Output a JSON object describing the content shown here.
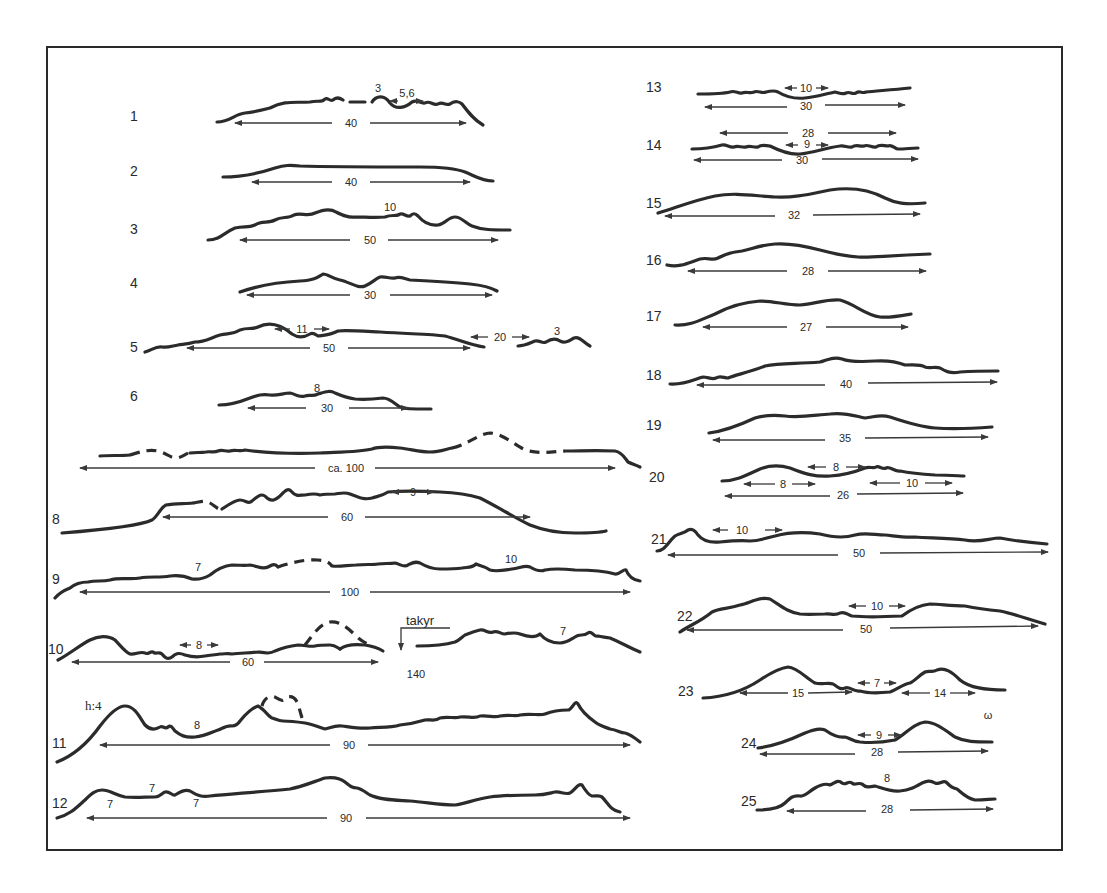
{
  "figure": {
    "type": "dune/relief profile sketches",
    "profiles": [
      {
        "id": "1",
        "label": "1",
        "span": "40",
        "annotations": [
          "3",
          "5,6"
        ]
      },
      {
        "id": "2",
        "label": "2",
        "span": "40",
        "annotations": []
      },
      {
        "id": "3",
        "label": "3",
        "span": "50",
        "annotations": [
          "10"
        ]
      },
      {
        "id": "4",
        "label": "4",
        "span": "30",
        "annotations": []
      },
      {
        "id": "5",
        "label": "5",
        "span": "50",
        "annotations": [
          "11",
          "20",
          "3"
        ]
      },
      {
        "id": "6",
        "label": "6",
        "span": "30",
        "annotations": [
          "8"
        ]
      },
      {
        "id": "7",
        "label": "",
        "span": "ca. 100",
        "annotations": []
      },
      {
        "id": "8",
        "label": "8",
        "span": "60",
        "annotations": [
          "9"
        ]
      },
      {
        "id": "9",
        "label": "9",
        "span": "100",
        "annotations": [
          "7",
          "10"
        ]
      },
      {
        "id": "10",
        "label": "10",
        "span": "60",
        "annotations": [
          "8",
          "takyr",
          "7",
          "140"
        ]
      },
      {
        "id": "11",
        "label": "11",
        "span": "90",
        "annotations": [
          "h:4",
          "8"
        ]
      },
      {
        "id": "12",
        "label": "12",
        "span": "90",
        "annotations": [
          "7",
          "7",
          "7"
        ]
      },
      {
        "id": "13",
        "label": "13",
        "span": "30",
        "annotations": [
          "10"
        ]
      },
      {
        "id": "14",
        "label": "14",
        "span": "30",
        "annotations": [
          "28",
          "9"
        ]
      },
      {
        "id": "15",
        "label": "15",
        "span": "32",
        "annotations": []
      },
      {
        "id": "16",
        "label": "16",
        "span": "28",
        "annotations": []
      },
      {
        "id": "17",
        "label": "17",
        "span": "27",
        "annotations": []
      },
      {
        "id": "18",
        "label": "18",
        "span": "40",
        "annotations": []
      },
      {
        "id": "19",
        "label": "19",
        "span": "35",
        "annotations": []
      },
      {
        "id": "20",
        "label": "20",
        "span": "26",
        "annotations": [
          "8",
          "8",
          "10"
        ]
      },
      {
        "id": "21",
        "label": "21",
        "span": "50",
        "annotations": [
          "10"
        ]
      },
      {
        "id": "22",
        "label": "22",
        "span": "50",
        "annotations": [
          "10"
        ]
      },
      {
        "id": "23",
        "label": "23",
        "span": "",
        "annotations": [
          "15",
          "7",
          "14"
        ]
      },
      {
        "id": "24",
        "label": "24",
        "span": "28",
        "annotations": [
          "9"
        ]
      },
      {
        "id": "25",
        "label": "25",
        "span": "28",
        "annotations": [
          "8"
        ]
      }
    ],
    "texts": {
      "p1_a": "3",
      "p1_b": "5,6",
      "p1_span": "40",
      "p2_span": "40",
      "p3_a": "10",
      "p3_span": "50",
      "p4_span": "30",
      "p5_a": "11",
      "p5_span": "50",
      "p5_b": "20",
      "p5_c": "3",
      "p6_a": "8",
      "p6_span": "30",
      "p7_span": "ca. 100",
      "p8_a": "9",
      "p8_span": "60",
      "p9_a": "7",
      "p9_b": "10",
      "p9_span": "100",
      "p10_a": "8",
      "p10_span": "60",
      "takyr": "takyr",
      "p10_b": "7",
      "p10_c": "140",
      "p11_h": "h:4",
      "p11_a": "8",
      "p11_span": "90",
      "p12_a": "7",
      "p12_b": "7",
      "p12_c": "7",
      "p12_span": "90",
      "p13_a": "10",
      "p13_span": "30",
      "p14_a": "28",
      "p14_b": "9",
      "p14_span": "30",
      "p15_span": "32",
      "p16_span": "28",
      "p17_span": "27",
      "p18_span": "40",
      "p19_span": "35",
      "p20_a": "8",
      "p20_b": "8",
      "p20_c": "10",
      "p20_span": "26",
      "p21_a": "10",
      "p21_span": "50",
      "p22_a": "10",
      "p22_span": "50",
      "p23_a": "15",
      "p23_b": "7",
      "p23_c": "14",
      "p24_a": "9",
      "p24_span": "28",
      "p25_a": "8",
      "p25_span": "28",
      "stray_mark": "ω"
    }
  }
}
